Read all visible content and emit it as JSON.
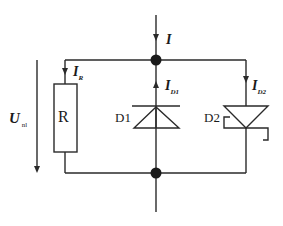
{
  "diagram": {
    "type": "circuit-schematic",
    "colors": {
      "line": "#2a2a2a",
      "background": "#ffffff"
    },
    "components": [
      {
        "id": "R",
        "label": "R",
        "kind": "resistor"
      },
      {
        "id": "D1",
        "label": "D1",
        "kind": "diode"
      },
      {
        "id": "D2",
        "label": "D2",
        "kind": "zener-diode"
      }
    ],
    "currents": {
      "total": {
        "symbol": "I",
        "subscript": ""
      },
      "resistor": {
        "symbol": "I",
        "subscript": "R"
      },
      "d1": {
        "symbol": "I",
        "subscript": "D1"
      },
      "d2": {
        "symbol": "I",
        "subscript": "D2"
      }
    },
    "voltage": {
      "symbol": "U",
      "subscript": "nl"
    }
  }
}
